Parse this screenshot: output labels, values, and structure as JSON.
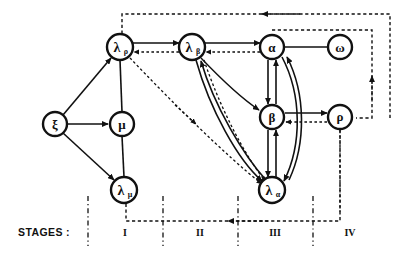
{
  "figure": {
    "kind": "directed-graph-diagram",
    "background": "#ffffff",
    "ink": "#111111",
    "width": 405,
    "height": 256
  },
  "legend": {
    "stages_title": "STAGES :"
  },
  "stages": [
    {
      "id": "stage-1",
      "label": "I",
      "label_x": 125,
      "divider_x": 88
    },
    {
      "id": "stage-2",
      "label": "II",
      "label_x": 200,
      "divider_x": 163
    },
    {
      "id": "stage-3",
      "label": "III",
      "label_x": 275,
      "divider_x": 238
    },
    {
      "id": "stage-4",
      "label": "IV",
      "label_x": 350,
      "divider_x": 313
    }
  ],
  "nodes": [
    {
      "id": "xi",
      "label": "ξ",
      "sub": "",
      "x": 55,
      "y": 124,
      "r": 12
    },
    {
      "id": "lambda-rho",
      "label": "λ",
      "sub": "ρ",
      "x": 120,
      "y": 47,
      "r": 13
    },
    {
      "id": "mu",
      "label": "μ",
      "sub": "",
      "x": 122,
      "y": 124,
      "r": 12
    },
    {
      "id": "lambda-mu",
      "label": "λ",
      "sub": "μ",
      "x": 124,
      "y": 190,
      "r": 13
    },
    {
      "id": "lambda-beta",
      "label": "λ",
      "sub": "β",
      "x": 192,
      "y": 47,
      "r": 13
    },
    {
      "id": "alpha",
      "label": "α",
      "sub": "",
      "x": 272,
      "y": 47,
      "r": 12
    },
    {
      "id": "omega",
      "label": "ω",
      "sub": "",
      "x": 340,
      "y": 47,
      "r": 12
    },
    {
      "id": "beta",
      "label": "β",
      "sub": "",
      "x": 272,
      "y": 117,
      "r": 12
    },
    {
      "id": "rho",
      "label": "ρ",
      "sub": "",
      "x": 340,
      "y": 117,
      "r": 12
    },
    {
      "id": "lambda-alpha",
      "label": "λ",
      "sub": "α",
      "x": 272,
      "y": 190,
      "r": 13
    }
  ],
  "edges": [
    {
      "id": "xi-to-lambda-rho",
      "from": "xi",
      "to": "lambda-rho",
      "style": "solid",
      "arrow": true
    },
    {
      "id": "xi-to-mu",
      "from": "xi",
      "to": "mu",
      "style": "solid",
      "arrow": true
    },
    {
      "id": "xi-to-lambda-mu",
      "from": "xi",
      "to": "lambda-mu",
      "style": "solid",
      "arrow": true
    },
    {
      "id": "lambda-rho-to-mu",
      "from": "lambda-rho",
      "to": "mu",
      "style": "solid",
      "arrow": false
    },
    {
      "id": "mu-to-lambda-mu",
      "from": "mu",
      "to": "lambda-mu",
      "style": "solid",
      "arrow": false
    },
    {
      "id": "lambda-rho-to-lambda-beta",
      "from": "lambda-rho",
      "to": "lambda-beta",
      "style": "solid",
      "arrow": true
    },
    {
      "id": "lambda-beta-to-lambda-rho",
      "from": "lambda-beta",
      "to": "lambda-rho",
      "style": "dashed",
      "arrow": true
    },
    {
      "id": "lambda-beta-to-alpha",
      "from": "lambda-beta",
      "to": "alpha",
      "style": "solid",
      "arrow": true
    },
    {
      "id": "alpha-to-lambda-beta",
      "from": "alpha",
      "to": "lambda-beta",
      "style": "dashed",
      "arrow": true
    },
    {
      "id": "alpha-to-omega",
      "from": "alpha",
      "to": "omega",
      "style": "solid",
      "arrow": false
    },
    {
      "id": "alpha-to-beta",
      "from": "alpha",
      "to": "beta",
      "style": "solid",
      "arrow": true
    },
    {
      "id": "beta-to-alpha",
      "from": "beta",
      "to": "alpha",
      "style": "solid",
      "arrow": true
    },
    {
      "id": "beta-to-lambda-alpha",
      "from": "beta",
      "to": "lambda-alpha",
      "style": "solid",
      "arrow": true
    },
    {
      "id": "lambda-alpha-to-beta",
      "from": "lambda-alpha",
      "to": "beta",
      "style": "solid",
      "arrow": true
    },
    {
      "id": "alpha-to-lambda-alpha",
      "from": "alpha",
      "to": "lambda-alpha",
      "style": "solid-curved",
      "arrow": true
    },
    {
      "id": "lambda-alpha-to-alpha",
      "from": "lambda-alpha",
      "to": "alpha",
      "style": "solid-curved",
      "arrow": true
    },
    {
      "id": "lambda-beta-to-lambda-alpha",
      "from": "lambda-beta",
      "to": "lambda-alpha",
      "style": "solid-curved",
      "arrow": true
    },
    {
      "id": "lambda-alpha-to-lambda-beta",
      "from": "lambda-alpha",
      "to": "lambda-beta",
      "style": "solid-curved",
      "arrow": true
    },
    {
      "id": "lambda-beta-to-lambda-alpha-dashed",
      "from": "lambda-beta",
      "to": "lambda-alpha",
      "style": "dashed",
      "arrow": true
    },
    {
      "id": "lambda-rho-to-lambda-alpha-dashed",
      "from": "lambda-rho",
      "to": "lambda-alpha",
      "style": "dashed",
      "arrow": true
    },
    {
      "id": "beta-to-rho",
      "from": "beta",
      "to": "rho",
      "style": "solid",
      "arrow": true
    },
    {
      "id": "rho-to-beta",
      "from": "rho",
      "to": "beta",
      "style": "dashed",
      "arrow": true
    },
    {
      "id": "feedback-top-to-lambda-rho",
      "from": "rho-right-bus",
      "to": "lambda-rho",
      "style": "dashed",
      "arrow": true
    },
    {
      "id": "feedback-omega-to-rho",
      "from": "omega-right-bus",
      "to": "rho",
      "style": "dashed",
      "arrow": true
    },
    {
      "id": "feedback-bottom-to-stage-one",
      "from": "rho",
      "to": "lambda-mu-bus",
      "style": "dashed",
      "arrow": true
    }
  ]
}
